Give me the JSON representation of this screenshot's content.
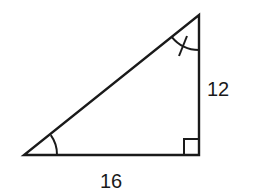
{
  "diagram": {
    "type": "right-triangle",
    "colors": {
      "stroke": "#1a1a1a",
      "background": "#ffffff"
    },
    "vertices": {
      "bottom_left": [
        24,
        155
      ],
      "bottom_right": [
        199,
        155
      ],
      "top": [
        199,
        15
      ]
    },
    "labels": {
      "vertical_leg": "12",
      "horizontal_leg": "16"
    },
    "marks": {
      "right_angle": "bottom-right",
      "angle_arc_single": "bottom-left",
      "angle_arc_with_tick": "top"
    }
  }
}
